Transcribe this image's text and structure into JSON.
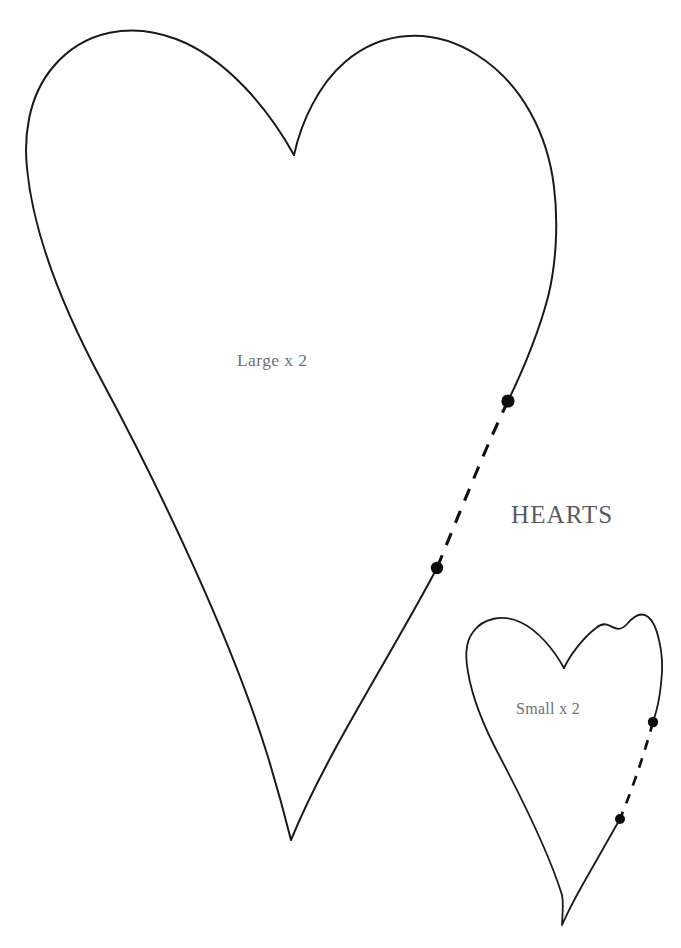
{
  "sheet": {
    "title": "HEARTS",
    "background_color": "#ffffff",
    "width": 681,
    "height": 948,
    "kind": "sewing-pattern-template"
  },
  "labels": {
    "title": "HEARTS",
    "large_piece": "Large x 2",
    "small_piece": "Small x 2",
    "label_color": "#6f6f73",
    "title_color": "#5a5a5f"
  },
  "pieces": [
    {
      "name": "large-heart",
      "label": "Large x 2",
      "quantity": 2,
      "outline_color": "#1a1a1a",
      "stroke_width": 2.0,
      "bounds": {
        "left": 27,
        "top": 33,
        "right": 556,
        "bottom": 840
      },
      "notch": {
        "x": 294,
        "y": 155
      },
      "tip": {
        "x": 291,
        "y": 840
      },
      "opening": {
        "style": "dashed",
        "dash_color": "#111111",
        "start_dot": {
          "x": 508,
          "y": 401
        },
        "end_dot": {
          "x": 437,
          "y": 568
        }
      }
    },
    {
      "name": "small-heart",
      "label": "Small x 2",
      "quantity": 2,
      "outline_color": "#1a1a1a",
      "stroke_width": 1.8,
      "bounds": {
        "left": 467,
        "top": 621,
        "right": 662,
        "bottom": 925
      },
      "notch": {
        "x": 564,
        "y": 668
      },
      "tip": {
        "x": 562,
        "y": 925
      },
      "opening": {
        "style": "dashed",
        "dash_color": "#111111",
        "start_dot": {
          "x": 653,
          "y": 722
        },
        "end_dot": {
          "x": 620,
          "y": 819
        }
      }
    }
  ]
}
